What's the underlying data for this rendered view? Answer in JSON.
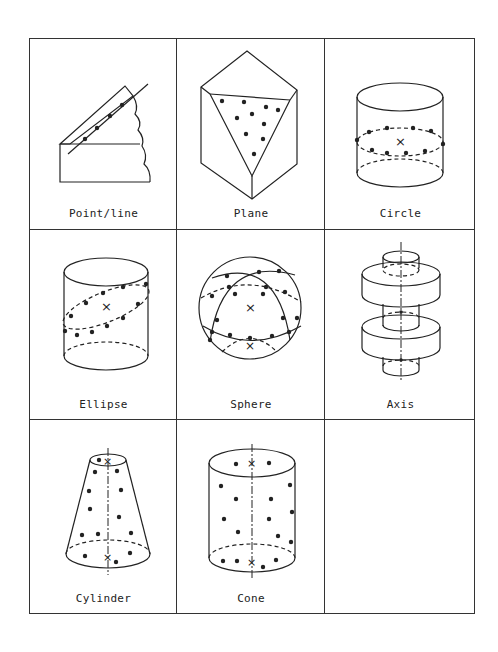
{
  "figure": {
    "grid": {
      "rows": 3,
      "columns": 3
    },
    "cells": [
      {
        "label": "Point/line",
        "icon": "point-line-icon"
      },
      {
        "label": "Plane",
        "icon": "plane-icon"
      },
      {
        "label": "Circle",
        "icon": "circle-icon"
      },
      {
        "label": "Ellipse",
        "icon": "ellipse-icon"
      },
      {
        "label": "Sphere",
        "icon": "sphere-icon"
      },
      {
        "label": "Axis",
        "icon": "axis-icon"
      },
      {
        "label": "Cylinder",
        "icon": "cylinder-icon"
      },
      {
        "label": "Cone",
        "icon": "cone-icon"
      },
      {
        "label": "",
        "icon": ""
      }
    ],
    "colors": {
      "line": "#222222",
      "background": "#ffffff"
    }
  }
}
